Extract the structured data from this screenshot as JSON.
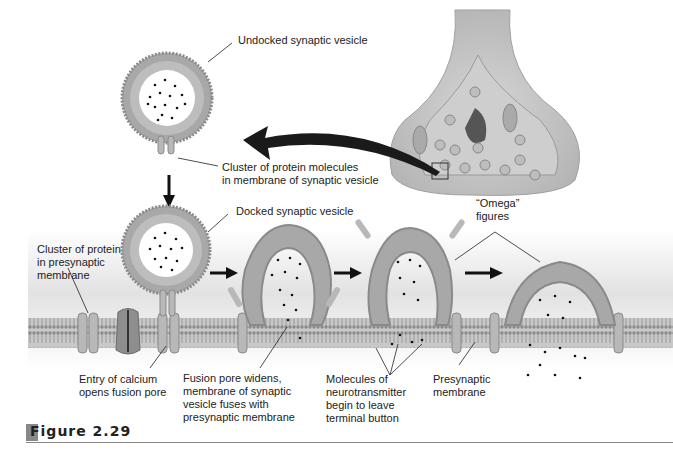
{
  "figure": {
    "caption": "Figure 2.29",
    "labels": {
      "undocked_vesicle": "Undocked synaptic vesicle",
      "vesicle_protein_cluster": "Cluster of protein molecules\nin membrane of synaptic vesicle",
      "docked_vesicle": "Docked synaptic vesicle",
      "membrane_protein_cluster": "Cluster of protein\nin presynaptic\nmembrane",
      "omega_figures": "“Omega”\nfigures",
      "calcium_entry": "Entry of calcium\nopens fusion pore",
      "fusion_pore": "Fusion pore widens,\nmembrane of synaptic\nvesicle fuses with\npresynaptic membrane",
      "neurotransmitter_release": "Molecules of\nneurotransmitter\nbegin to leave\nterminal button",
      "presynaptic_membrane": "Presynaptic\nmembrane"
    },
    "colors": {
      "membrane": "#9a9a9a",
      "membrane_dark": "#6e6e6e",
      "background_band": "#e4e4e4",
      "arrow": "#111111",
      "text": "#222222"
    }
  }
}
